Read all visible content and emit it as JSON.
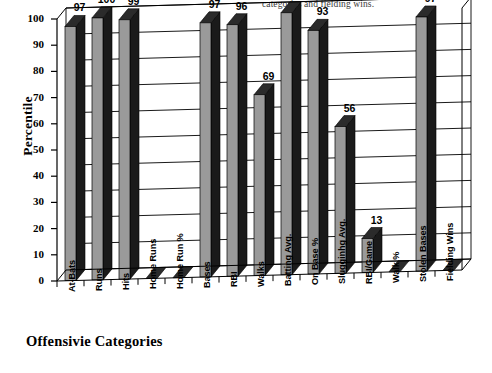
{
  "caption": "categories and fielding wins.",
  "axes": {
    "ylabel": "Percentile",
    "xlabel": "Offensivie Categories",
    "yticks": [
      "0",
      "10",
      "20",
      "30",
      "40",
      "50",
      "60",
      "70",
      "80",
      "90",
      "100"
    ]
  },
  "colors": {
    "bar_face": "#9a9a9a",
    "bar_side": "#1a1a1a",
    "bar_top": "#2b2b2b",
    "axis": "#000000",
    "grid": "#000000",
    "background": "#ffffff"
  },
  "chart_data": {
    "type": "bar",
    "title": "",
    "subtitle": "categories and fielding wins.",
    "xlabel": "Offensivie Categories",
    "ylabel": "Percentile",
    "ylim": [
      0,
      100
    ],
    "ytick_step": 10,
    "grid": true,
    "legend": "none",
    "style": "3d-column",
    "categories": [
      "At-Bats",
      "Runs",
      "Hits",
      "Home Runs",
      "Home Run %",
      "Bases",
      "RBI",
      "Walks",
      "Batting Avg.",
      "On Base %",
      "Slugginhg Avg.",
      "RBI/Game",
      "Walk %",
      "Stolen Bases",
      "Fielding Wins"
    ],
    "values": [
      97,
      100,
      99,
      0,
      0,
      97,
      96,
      69,
      100,
      93,
      56,
      13,
      0,
      97,
      0
    ],
    "value_labels": [
      "97",
      "100",
      "99",
      "",
      "",
      "97",
      "96",
      "69",
      "100",
      "93",
      "56",
      "13",
      "",
      "97",
      ""
    ]
  }
}
